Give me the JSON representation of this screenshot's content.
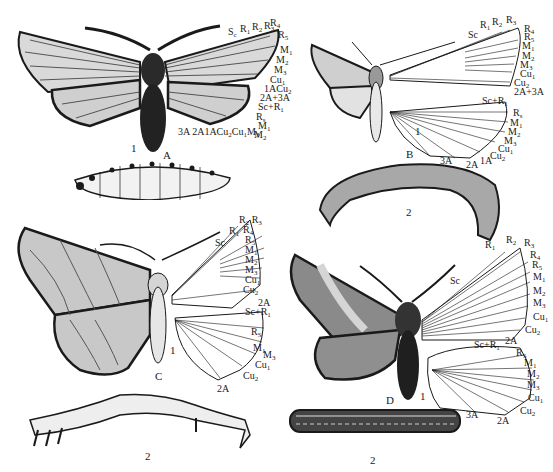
{
  "figure": {
    "background": "#ffffff",
    "ink": "#1a1a1a",
    "panels": [
      {
        "id": "A",
        "letter": "A",
        "adult_label": "1",
        "larva_label": "",
        "forewing_veins": [
          "Sc",
          "R1",
          "R2",
          "R3",
          "R4",
          "R5",
          "M1",
          "M2",
          "M3",
          "Cu1",
          "Cu2",
          "1A",
          "2A+3A"
        ],
        "hindwing_veins": [
          "Sc+R1",
          "Rs",
          "M1",
          "M2",
          "M3",
          "Cu1",
          "Cu2",
          "1A",
          "2A",
          "3A"
        ],
        "bottom_labels": "3A 2A 1A Cu2 Cu1 M3"
      },
      {
        "id": "B",
        "letter": "B",
        "adult_label": "1",
        "larva_label": "2",
        "forewing_veins": [
          "Sc",
          "R1",
          "R2",
          "R3",
          "R4",
          "R5",
          "M1",
          "M2",
          "M3",
          "Cu1",
          "Cu2",
          "2A+3A"
        ],
        "hindwing_veins": [
          "Sc+R1",
          "Rs",
          "M1",
          "M2",
          "M3",
          "Cu1",
          "Cu2",
          "1A",
          "2A",
          "3A"
        ]
      },
      {
        "id": "C",
        "letter": "C",
        "adult_label": "1",
        "larva_label": "2",
        "forewing_veins": [
          "R1",
          "R2",
          "R3",
          "R4",
          "Sc",
          "R5",
          "M1",
          "M2",
          "M3",
          "Cu1",
          "Cu2",
          "2A"
        ],
        "hindwing_veins": [
          "Sc+R1",
          "Rs",
          "M1",
          "M3",
          "Cu1",
          "Cu2",
          "2A"
        ]
      },
      {
        "id": "D",
        "letter": "D",
        "adult_label": "1",
        "larva_label": "2",
        "forewing_veins": [
          "R1",
          "R2",
          "R3",
          "R4",
          "R5",
          "Sc",
          "M1",
          "M2",
          "M3",
          "Cu1",
          "Cu2",
          "2A"
        ],
        "hindwing_veins": [
          "Sc+R1",
          "Rs",
          "M1",
          "M2",
          "M3",
          "Cu1",
          "Cu2",
          "2A",
          "3A"
        ]
      }
    ]
  },
  "labels": {
    "A": {
      "letter": "A",
      "num1": "1"
    },
    "B": {
      "letter": "B",
      "num1": "1",
      "num2": "2"
    },
    "C": {
      "letter": "C",
      "num1": "1",
      "num2": "2"
    },
    "D": {
      "letter": "D",
      "num1": "1",
      "num2": "2"
    }
  }
}
